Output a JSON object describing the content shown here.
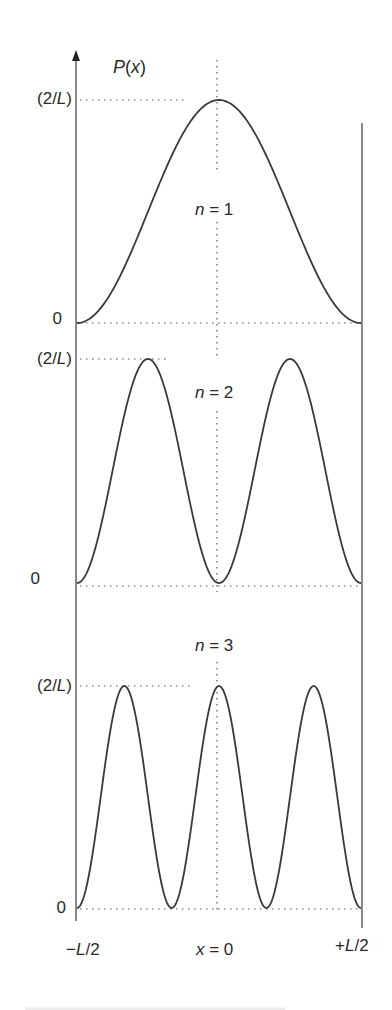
{
  "chart_data": {
    "type": "line",
    "title": "",
    "ylabel": "P(x)",
    "xlabel": "",
    "x_ticks": [
      "−L/2",
      "x = 0",
      "+L/2"
    ],
    "x_range": [
      "-L/2",
      "+L/2"
    ],
    "grid": false,
    "legend": null,
    "panels": [
      {
        "label": "n = 1",
        "y_ticks": [
          "0",
          "(2/L)"
        ],
        "function": "(2/L) cos^2(pi x / L)",
        "x": [
          -0.5,
          -0.25,
          0,
          0.25,
          0.5
        ],
        "values": [
          0,
          0.5,
          1,
          0.5,
          0
        ]
      },
      {
        "label": "n = 2",
        "y_ticks": [
          "0",
          "(2/L)"
        ],
        "function": "(2/L) sin^2(2 pi x / L)",
        "x": [
          -0.5,
          -0.375,
          -0.25,
          -0.125,
          0,
          0.125,
          0.25,
          0.375,
          0.5
        ],
        "values": [
          0,
          0.5,
          1,
          0.5,
          0,
          0.5,
          1,
          0.5,
          0
        ]
      },
      {
        "label": "n = 3",
        "y_ticks": [
          "0",
          "(2/L)"
        ],
        "function": "(2/L) cos^2(3 pi x / L)",
        "x": [
          -0.5,
          -0.3333,
          -0.1667,
          0,
          0.1667,
          0.3333,
          0.5
        ],
        "values": [
          0,
          1,
          0,
          1,
          0,
          1,
          0
        ]
      }
    ],
    "note": "y values expressed in units of (2/L); x in units of L"
  },
  "labels": {
    "y_axis": {
      "P": "P",
      "paren_open": "(",
      "x": "x",
      "paren_close": ")"
    },
    "panels": [
      {
        "n_var": "n",
        "n_eq": " = 1",
        "max_label_a": "(2/",
        "max_label_L": "L",
        "max_label_b": ")",
        "zero_label": "0"
      },
      {
        "n_var": "n",
        "n_eq": " = 2",
        "max_label_a": "(2/",
        "max_label_L": "L",
        "max_label_b": ")",
        "zero_label": "0"
      },
      {
        "n_var": "n",
        "n_eq": " = 3",
        "max_label_a": "(2/",
        "max_label_L": "L",
        "max_label_b": ")",
        "zero_label": "0"
      }
    ],
    "x_left": {
      "sign": "−",
      "L": "L",
      "rest": "/2"
    },
    "x_mid": {
      "x": "x",
      "rest": " = 0"
    },
    "x_right": {
      "sign": "+",
      "L": "L",
      "rest": "/2"
    }
  },
  "colors": {
    "curve": "#3a3a3a",
    "axis": "#4a4a4a",
    "dotted": "#555555"
  }
}
